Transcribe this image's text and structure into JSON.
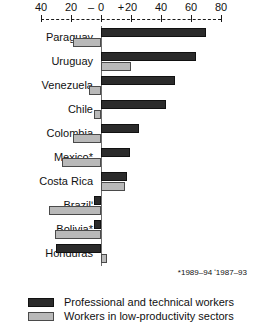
{
  "chart_data": {
    "type": "bar",
    "orientation": "horizontal",
    "title": "",
    "subtitle": "",
    "xlabel": "",
    "ylabel": "",
    "xlim": [
      -40,
      80
    ],
    "grid": false,
    "axis_note": "Diverging horizontal bars; negative values left of zero, positive right of zero",
    "legend_position": "bottom-left",
    "categories": [
      "Paraguay",
      "Uruguay",
      "Venezuela",
      "Chile",
      "Colombia",
      "Mexico*",
      "Costa Rica",
      "Brazilʹ",
      "Bolivia*",
      "Honduras"
    ],
    "series": [
      {
        "name": "Professional and technical workers",
        "color": "#2b2b2b",
        "values": [
          70,
          63,
          49,
          43,
          25,
          19,
          17,
          -5,
          -5,
          -30
        ]
      },
      {
        "name": "Workers in low-productivity sectors",
        "color": "#b9b9b9",
        "values": [
          -19,
          20,
          -8,
          -5,
          -19,
          -26,
          16,
          -35,
          -31,
          4
        ]
      }
    ],
    "tick_values": [
      -40,
      -20,
      0,
      20,
      40,
      60,
      80
    ],
    "tick_labels": [
      "40",
      "20",
      "0",
      "20",
      "40",
      "60",
      "80"
    ],
    "sign_left": "–",
    "sign_right": "+",
    "footnote": "*1989–94  ʹ1987–93"
  },
  "legend": {
    "items": [
      {
        "label": "Professional and technical workers",
        "swatch": "dark"
      },
      {
        "label": "Workers in low-productivity sectors",
        "swatch": "light"
      }
    ]
  }
}
